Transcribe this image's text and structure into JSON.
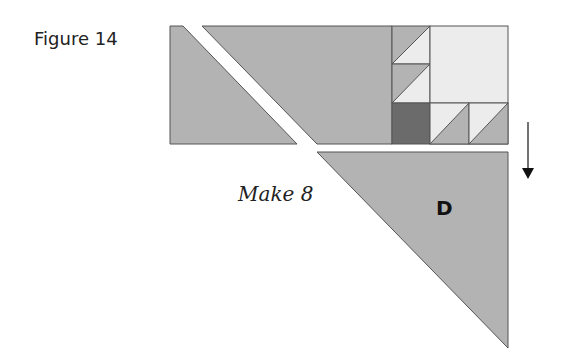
{
  "figure": {
    "label": "Figure 14",
    "instruction": "Make 8",
    "piece_label": "D",
    "arrow_direction": "down"
  },
  "colors": {
    "medium_gray": "#b3b3b3",
    "light_fill": "#ececec",
    "dark_gray": "#6b6b6b",
    "outline": "#555555",
    "text": "#222222"
  }
}
